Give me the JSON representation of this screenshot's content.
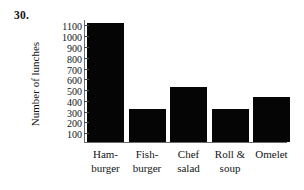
{
  "problem": {
    "number": "30."
  },
  "chart_data": {
    "type": "bar",
    "title": "",
    "xlabel": "",
    "ylabel": "Number of lunches",
    "categories": [
      "Ham-burger",
      "Fish-burger",
      "Chef salad",
      "Roll & soup",
      "Omelet"
    ],
    "category_lines": [
      {
        "line1": "Ham-",
        "line2": "burger"
      },
      {
        "line1": "Fish-",
        "line2": "burger"
      },
      {
        "line1": "Chef",
        "line2": "salad"
      },
      {
        "line1": "Roll &",
        "line2": "soup"
      },
      {
        "line1": "Omelet",
        "line2": ""
      }
    ],
    "values": [
      1100,
      310,
      510,
      310,
      420
    ],
    "ylim": [
      0,
      1150
    ],
    "ytick_values": [
      100,
      200,
      300,
      400,
      500,
      600,
      700,
      800,
      900,
      1000,
      1100
    ],
    "ytick_labels": [
      "100",
      "200",
      "300",
      "400",
      "500",
      "600",
      "700",
      "800",
      "900",
      "1000",
      "1100"
    ],
    "grid": false,
    "legend": null,
    "bar_color": "#050505",
    "axis_color": "#6b6b6b"
  }
}
